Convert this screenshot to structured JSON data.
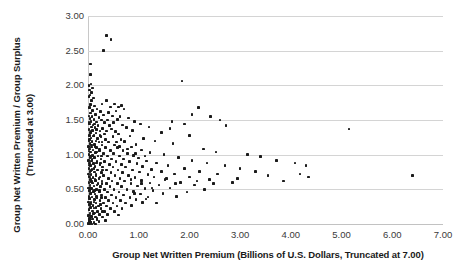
{
  "chart_data": {
    "type": "scatter",
    "title": "",
    "xlabel": "Group Net Written Premium (Billions of U.S. Dollars, Truncated at 7.00)",
    "ylabel": "Group Net Written Premium / Group Surplus",
    "ylabel_line2": "(Truncated at 3.00)",
    "xlim": [
      0.0,
      7.0
    ],
    "ylim": [
      0.0,
      3.0
    ],
    "xticks": [
      "0.00",
      "1.00",
      "2.00",
      "3.00",
      "4.00",
      "5.00",
      "6.00",
      "7.00"
    ],
    "xtick_values": [
      0.0,
      1.0,
      2.0,
      3.0,
      4.0,
      5.0,
      6.0,
      7.0
    ],
    "yticks": [
      "0.00",
      "0.50",
      "1.00",
      "1.50",
      "2.00",
      "2.50",
      "3.00"
    ],
    "ytick_values": [
      0.0,
      0.5,
      1.0,
      1.5,
      2.0,
      2.5,
      3.0
    ],
    "grid": "horizontal",
    "legend": "none",
    "marker": "square",
    "marker_color": "#1b1b1b",
    "background_color": "#ffffff",
    "gridline_color": "#d4d4d4",
    "points": [
      [
        0.36,
        2.72
      ],
      [
        0.45,
        2.66
      ],
      [
        0.3,
        2.5
      ],
      [
        0.05,
        2.31
      ],
      [
        0.05,
        2.16
      ],
      [
        0.06,
        2.02
      ],
      [
        0.02,
        2.0
      ],
      [
        1.85,
        2.06
      ],
      [
        0.09,
        1.96
      ],
      [
        0.03,
        1.93
      ],
      [
        0.07,
        1.9
      ],
      [
        0.04,
        1.86
      ],
      [
        0.02,
        1.84
      ],
      [
        0.11,
        1.82
      ],
      [
        0.36,
        1.78
      ],
      [
        0.52,
        1.73
      ],
      [
        0.07,
        1.78
      ],
      [
        0.28,
        1.73
      ],
      [
        0.05,
        1.72
      ],
      [
        0.13,
        1.7
      ],
      [
        0.44,
        1.69
      ],
      [
        0.6,
        1.69
      ],
      [
        0.66,
        1.71
      ],
      [
        0.18,
        1.66
      ],
      [
        0.03,
        1.68
      ],
      [
        0.09,
        1.64
      ],
      [
        0.25,
        1.62
      ],
      [
        0.4,
        1.61
      ],
      [
        0.55,
        1.63
      ],
      [
        0.71,
        1.66
      ],
      [
        0.05,
        1.6
      ],
      [
        0.15,
        1.58
      ],
      [
        0.31,
        1.57
      ],
      [
        0.02,
        1.56
      ],
      [
        0.08,
        1.55
      ],
      [
        0.22,
        1.54
      ],
      [
        0.48,
        1.56
      ],
      [
        0.63,
        1.55
      ],
      [
        2.18,
        1.68
      ],
      [
        0.04,
        1.52
      ],
      [
        0.12,
        1.51
      ],
      [
        0.27,
        1.5
      ],
      [
        0.38,
        1.5
      ],
      [
        0.58,
        1.51
      ],
      [
        0.8,
        1.53
      ],
      [
        0.06,
        1.48
      ],
      [
        0.17,
        1.47
      ],
      [
        0.33,
        1.46
      ],
      [
        0.5,
        1.46
      ],
      [
        0.92,
        1.48
      ],
      [
        2.42,
        1.55
      ],
      [
        2.6,
        1.5
      ],
      [
        0.03,
        1.44
      ],
      [
        0.1,
        1.43
      ],
      [
        0.2,
        1.42
      ],
      [
        0.42,
        1.42
      ],
      [
        0.68,
        1.43
      ],
      [
        1.03,
        1.44
      ],
      [
        5.15,
        1.37
      ],
      [
        0.07,
        1.4
      ],
      [
        0.14,
        1.39
      ],
      [
        0.29,
        1.38
      ],
      [
        0.46,
        1.37
      ],
      [
        0.76,
        1.39
      ],
      [
        1.2,
        1.4
      ],
      [
        0.02,
        1.36
      ],
      [
        0.09,
        1.35
      ],
      [
        0.24,
        1.34
      ],
      [
        0.37,
        1.34
      ],
      [
        0.54,
        1.33
      ],
      [
        0.88,
        1.35
      ],
      [
        0.05,
        1.32
      ],
      [
        0.16,
        1.31
      ],
      [
        0.32,
        1.3
      ],
      [
        0.6,
        1.3
      ],
      [
        1.45,
        1.32
      ],
      [
        0.03,
        1.28
      ],
      [
        0.11,
        1.27
      ],
      [
        0.26,
        1.26
      ],
      [
        0.49,
        1.26
      ],
      [
        0.83,
        1.27
      ],
      [
        2.0,
        1.28
      ],
      [
        0.06,
        1.24
      ],
      [
        0.19,
        1.23
      ],
      [
        0.35,
        1.22
      ],
      [
        0.65,
        1.22
      ],
      [
        1.1,
        1.23
      ],
      [
        0.02,
        1.2
      ],
      [
        0.08,
        1.19
      ],
      [
        0.22,
        1.18
      ],
      [
        0.41,
        1.18
      ],
      [
        0.72,
        1.19
      ],
      [
        1.32,
        1.2
      ],
      [
        0.04,
        1.16
      ],
      [
        0.13,
        1.15
      ],
      [
        0.28,
        1.14
      ],
      [
        0.52,
        1.14
      ],
      [
        0.95,
        1.15
      ],
      [
        1.68,
        1.16
      ],
      [
        0.01,
        1.12
      ],
      [
        0.07,
        1.11
      ],
      [
        0.17,
        1.1
      ],
      [
        0.34,
        1.1
      ],
      [
        0.58,
        1.1
      ],
      [
        0.86,
        1.11
      ],
      [
        0.03,
        1.08
      ],
      [
        0.1,
        1.07
      ],
      [
        0.23,
        1.06
      ],
      [
        0.44,
        1.06
      ],
      [
        0.69,
        1.06
      ],
      [
        1.05,
        1.07
      ],
      [
        2.28,
        1.08
      ],
      [
        0.05,
        1.04
      ],
      [
        0.15,
        1.03
      ],
      [
        0.3,
        1.02
      ],
      [
        0.5,
        1.02
      ],
      [
        0.78,
        1.02
      ],
      [
        1.22,
        1.03
      ],
      [
        2.52,
        1.04
      ],
      [
        0.02,
        1.0
      ],
      [
        0.09,
        0.99
      ],
      [
        0.2,
        0.98
      ],
      [
        0.38,
        0.98
      ],
      [
        0.62,
        0.98
      ],
      [
        0.9,
        0.99
      ],
      [
        1.5,
        1.0
      ],
      [
        3.15,
        1.0
      ],
      [
        0.04,
        0.96
      ],
      [
        0.12,
        0.95
      ],
      [
        0.26,
        0.94
      ],
      [
        0.46,
        0.94
      ],
      [
        0.7,
        0.94
      ],
      [
        1.0,
        0.95
      ],
      [
        1.78,
        0.96
      ],
      [
        3.4,
        0.97
      ],
      [
        0.01,
        0.92
      ],
      [
        0.07,
        0.91
      ],
      [
        0.18,
        0.9
      ],
      [
        0.33,
        0.9
      ],
      [
        0.55,
        0.9
      ],
      [
        0.82,
        0.9
      ],
      [
        1.15,
        0.91
      ],
      [
        2.05,
        0.92
      ],
      [
        3.72,
        0.92
      ],
      [
        0.03,
        0.88
      ],
      [
        0.11,
        0.87
      ],
      [
        0.24,
        0.86
      ],
      [
        0.42,
        0.86
      ],
      [
        0.66,
        0.86
      ],
      [
        0.97,
        0.87
      ],
      [
        1.35,
        0.88
      ],
      [
        2.35,
        0.88
      ],
      [
        4.08,
        0.88
      ],
      [
        0.05,
        0.84
      ],
      [
        0.14,
        0.83
      ],
      [
        0.29,
        0.82
      ],
      [
        0.49,
        0.82
      ],
      [
        0.74,
        0.82
      ],
      [
        1.08,
        0.83
      ],
      [
        1.58,
        0.84
      ],
      [
        2.7,
        0.84
      ],
      [
        4.3,
        0.84
      ],
      [
        0.02,
        0.8
      ],
      [
        0.08,
        0.79
      ],
      [
        0.19,
        0.78
      ],
      [
        0.36,
        0.78
      ],
      [
        0.59,
        0.78
      ],
      [
        0.88,
        0.78
      ],
      [
        1.25,
        0.79
      ],
      [
        1.9,
        0.8
      ],
      [
        3.0,
        0.8
      ],
      [
        0.04,
        0.76
      ],
      [
        0.13,
        0.75
      ],
      [
        0.27,
        0.74
      ],
      [
        0.45,
        0.74
      ],
      [
        0.68,
        0.74
      ],
      [
        1.02,
        0.75
      ],
      [
        1.45,
        0.76
      ],
      [
        2.2,
        0.76
      ],
      [
        3.3,
        0.76
      ],
      [
        0.01,
        0.72
      ],
      [
        0.06,
        0.71
      ],
      [
        0.16,
        0.7
      ],
      [
        0.31,
        0.7
      ],
      [
        0.53,
        0.7
      ],
      [
        0.8,
        0.7
      ],
      [
        1.18,
        0.71
      ],
      [
        1.7,
        0.72
      ],
      [
        2.55,
        0.72
      ],
      [
        6.4,
        0.7
      ],
      [
        0.03,
        0.68
      ],
      [
        0.1,
        0.67
      ],
      [
        0.22,
        0.66
      ],
      [
        0.4,
        0.66
      ],
      [
        0.63,
        0.66
      ],
      [
        0.93,
        0.67
      ],
      [
        1.3,
        0.68
      ],
      [
        2.0,
        0.68
      ],
      [
        0.05,
        0.64
      ],
      [
        0.15,
        0.63
      ],
      [
        0.28,
        0.62
      ],
      [
        0.47,
        0.62
      ],
      [
        0.72,
        0.62
      ],
      [
        1.05,
        0.63
      ],
      [
        1.52,
        0.64
      ],
      [
        2.4,
        0.64
      ],
      [
        0.02,
        0.6
      ],
      [
        0.09,
        0.59
      ],
      [
        0.2,
        0.58
      ],
      [
        0.37,
        0.58
      ],
      [
        0.58,
        0.58
      ],
      [
        0.85,
        0.58
      ],
      [
        1.22,
        0.59
      ],
      [
        1.82,
        0.6
      ],
      [
        2.85,
        0.6
      ],
      [
        0.04,
        0.56
      ],
      [
        0.12,
        0.55
      ],
      [
        0.25,
        0.54
      ],
      [
        0.43,
        0.54
      ],
      [
        0.66,
        0.54
      ],
      [
        0.98,
        0.55
      ],
      [
        1.4,
        0.56
      ],
      [
        2.1,
        0.56
      ],
      [
        0.01,
        0.52
      ],
      [
        0.07,
        0.51
      ],
      [
        0.17,
        0.5
      ],
      [
        0.32,
        0.5
      ],
      [
        0.51,
        0.5
      ],
      [
        0.77,
        0.5
      ],
      [
        1.12,
        0.51
      ],
      [
        1.62,
        0.52
      ],
      [
        2.3,
        0.5
      ],
      [
        0.03,
        0.48
      ],
      [
        0.11,
        0.47
      ],
      [
        0.23,
        0.46
      ],
      [
        0.39,
        0.46
      ],
      [
        0.61,
        0.46
      ],
      [
        0.9,
        0.47
      ],
      [
        1.28,
        0.48
      ],
      [
        1.95,
        0.46
      ],
      [
        0.05,
        0.44
      ],
      [
        0.14,
        0.43
      ],
      [
        0.27,
        0.42
      ],
      [
        0.46,
        0.42
      ],
      [
        0.7,
        0.42
      ],
      [
        1.03,
        0.43
      ],
      [
        1.48,
        0.44
      ],
      [
        0.02,
        0.4
      ],
      [
        0.08,
        0.39
      ],
      [
        0.18,
        0.38
      ],
      [
        0.34,
        0.38
      ],
      [
        0.55,
        0.38
      ],
      [
        0.83,
        0.38
      ],
      [
        1.18,
        0.39
      ],
      [
        1.75,
        0.4
      ],
      [
        0.04,
        0.36
      ],
      [
        0.13,
        0.35
      ],
      [
        0.24,
        0.34
      ],
      [
        0.41,
        0.34
      ],
      [
        0.64,
        0.34
      ],
      [
        0.95,
        0.35
      ],
      [
        1.35,
        0.3
      ],
      [
        0.01,
        0.32
      ],
      [
        0.06,
        0.31
      ],
      [
        0.16,
        0.3
      ],
      [
        0.3,
        0.3
      ],
      [
        0.49,
        0.3
      ],
      [
        0.74,
        0.3
      ],
      [
        1.08,
        0.31
      ],
      [
        0.03,
        0.28
      ],
      [
        0.1,
        0.27
      ],
      [
        0.21,
        0.26
      ],
      [
        0.36,
        0.26
      ],
      [
        0.57,
        0.26
      ],
      [
        0.86,
        0.27
      ],
      [
        0.05,
        0.24
      ],
      [
        0.12,
        0.23
      ],
      [
        0.26,
        0.22
      ],
      [
        0.44,
        0.22
      ],
      [
        0.67,
        0.22
      ],
      [
        0.02,
        0.2
      ],
      [
        0.09,
        0.19
      ],
      [
        0.19,
        0.18
      ],
      [
        0.33,
        0.18
      ],
      [
        0.52,
        0.18
      ],
      [
        0.04,
        0.16
      ],
      [
        0.11,
        0.15
      ],
      [
        0.23,
        0.14
      ],
      [
        0.38,
        0.14
      ],
      [
        0.6,
        0.13
      ],
      [
        0.01,
        0.12
      ],
      [
        0.07,
        0.11
      ],
      [
        0.15,
        0.1
      ],
      [
        0.29,
        0.1
      ],
      [
        0.03,
        0.08
      ],
      [
        0.09,
        0.07
      ],
      [
        0.18,
        0.06
      ],
      [
        0.35,
        0.05
      ],
      [
        0.02,
        0.04
      ],
      [
        0.06,
        0.03
      ],
      [
        0.12,
        0.02
      ],
      [
        0.01,
        0.01
      ],
      [
        0.04,
        0.01
      ],
      [
        0.08,
        0.0
      ],
      [
        0.02,
        0.0
      ],
      [
        0.15,
        0.0
      ],
      [
        0.05,
        0.02
      ],
      [
        0.22,
        0.04
      ],
      [
        0.02,
        1.46
      ],
      [
        0.06,
        1.34
      ],
      [
        0.03,
        1.22
      ],
      [
        0.07,
        1.14
      ],
      [
        0.02,
        1.05
      ],
      [
        0.05,
        0.97
      ],
      [
        0.08,
        0.93
      ],
      [
        0.03,
        0.85
      ],
      [
        0.06,
        0.77
      ],
      [
        0.02,
        0.69
      ],
      [
        0.07,
        0.61
      ],
      [
        0.04,
        0.53
      ],
      [
        0.06,
        0.45
      ],
      [
        0.03,
        0.37
      ],
      [
        0.05,
        0.29
      ],
      [
        0.02,
        0.21
      ],
      [
        0.04,
        0.13
      ],
      [
        0.03,
        0.05
      ],
      [
        0.13,
        1.44
      ],
      [
        0.17,
        1.36
      ],
      [
        0.12,
        1.28
      ],
      [
        0.16,
        1.2
      ],
      [
        0.14,
        1.12
      ],
      [
        0.18,
        1.04
      ],
      [
        0.13,
        0.96
      ],
      [
        0.17,
        0.88
      ],
      [
        0.12,
        0.8
      ],
      [
        0.16,
        0.72
      ],
      [
        0.14,
        0.64
      ],
      [
        0.18,
        0.56
      ],
      [
        0.13,
        0.48
      ],
      [
        0.17,
        0.4
      ],
      [
        0.12,
        0.32
      ],
      [
        0.16,
        0.24
      ],
      [
        0.14,
        0.16
      ],
      [
        0.18,
        0.08
      ],
      [
        0.24,
        1.28
      ],
      [
        0.28,
        1.18
      ],
      [
        0.23,
        1.08
      ],
      [
        0.27,
        0.98
      ],
      [
        0.25,
        0.88
      ],
      [
        0.29,
        0.78
      ],
      [
        0.24,
        0.68
      ],
      [
        0.28,
        0.58
      ],
      [
        0.23,
        0.48
      ],
      [
        0.27,
        0.38
      ],
      [
        0.25,
        0.28
      ],
      [
        0.29,
        0.18
      ],
      [
        0.56,
        1.18
      ],
      [
        0.62,
        1.12
      ],
      [
        0.78,
        1.08
      ],
      [
        0.94,
        1.02
      ],
      [
        1.12,
        0.98
      ],
      [
        0.85,
        0.64
      ],
      [
        1.06,
        0.58
      ],
      [
        1.26,
        0.52
      ],
      [
        0.92,
        0.44
      ],
      [
        1.14,
        0.36
      ],
      [
        2.72,
        1.42
      ],
      [
        2.05,
        1.58
      ],
      [
        1.66,
        1.48
      ],
      [
        1.62,
        1.38
      ],
      [
        1.9,
        1.44
      ],
      [
        4.18,
        0.72
      ],
      [
        4.35,
        0.68
      ],
      [
        3.55,
        0.7
      ],
      [
        3.85,
        0.62
      ],
      [
        2.95,
        0.66
      ],
      [
        1.55,
        0.66
      ],
      [
        1.72,
        0.58
      ],
      [
        2.15,
        0.62
      ],
      [
        2.48,
        0.58
      ]
    ]
  }
}
